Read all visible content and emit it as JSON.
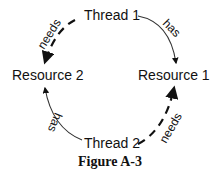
{
  "diagram": {
    "type": "resource-allocation-graph",
    "nodes": {
      "thread1": "Thread 1",
      "thread2": "Thread 2",
      "resource1": "Resource 1",
      "resource2": "Resource 2"
    },
    "edges": [
      {
        "from": "Thread 1",
        "to": "Resource 1",
        "label": "has",
        "style": "solid-thin"
      },
      {
        "from": "Thread 1",
        "to": "Resource 2",
        "label": "needs",
        "style": "dashed-thick"
      },
      {
        "from": "Thread 2",
        "to": "Resource 2",
        "label": "has",
        "style": "solid-thin"
      },
      {
        "from": "Thread 2",
        "to": "Resource 1",
        "label": "needs",
        "style": "dashed-thick"
      }
    ],
    "edge_labels": {
      "has_top": "has",
      "needs_top": "needs",
      "has_bottom": "has",
      "needs_bottom": "needs"
    },
    "caption": "Figure A-3",
    "colors": {
      "ink": "#111111",
      "background": "#ffffff"
    }
  }
}
